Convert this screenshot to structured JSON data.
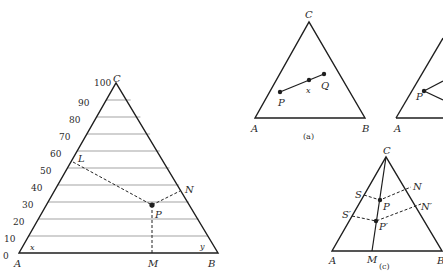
{
  "figure": {
    "main": {
      "vertices": {
        "A": "A",
        "B": "B",
        "C": "C"
      },
      "axis_ticks": [
        "0",
        "10",
        "20",
        "30",
        "40",
        "50",
        "60",
        "70",
        "80",
        "90",
        "100"
      ],
      "point_labels": {
        "L": "L",
        "N": "N",
        "P": "P",
        "M": "M",
        "x": "x",
        "y": "y"
      }
    },
    "panel_a": {
      "caption": "(a)",
      "vertices": {
        "A": "A",
        "B": "B",
        "C": "C"
      },
      "point_labels": {
        "P": "P",
        "x": "x",
        "Q": "Q"
      }
    },
    "panel_b": {
      "vertices": {
        "A": "A"
      },
      "point_labels": {
        "P": "P"
      }
    },
    "panel_c": {
      "caption": "(c)",
      "vertices": {
        "A": "A",
        "B": "B",
        "C": "C"
      },
      "point_labels": {
        "S": "S",
        "S_prime": "S′",
        "N": "N",
        "N_prime": "N′",
        "P": "P",
        "P_prime": "P′",
        "M": "M"
      }
    }
  }
}
